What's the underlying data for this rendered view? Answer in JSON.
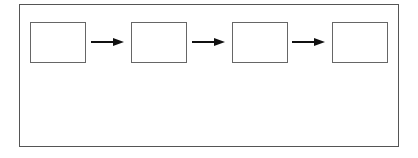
{
  "diagram": {
    "type": "flow",
    "direction": "left-to-right",
    "nodes": [
      {
        "id": "n1",
        "label": ""
      },
      {
        "id": "n2",
        "label": ""
      },
      {
        "id": "n3",
        "label": ""
      },
      {
        "id": "n4",
        "label": ""
      }
    ],
    "edges": [
      {
        "from": "n1",
        "to": "n2"
      },
      {
        "from": "n2",
        "to": "n3"
      },
      {
        "from": "n3",
        "to": "n4"
      }
    ],
    "colors": {
      "stroke": "#555555",
      "arrow": "#111111",
      "background": "#ffffff"
    }
  }
}
